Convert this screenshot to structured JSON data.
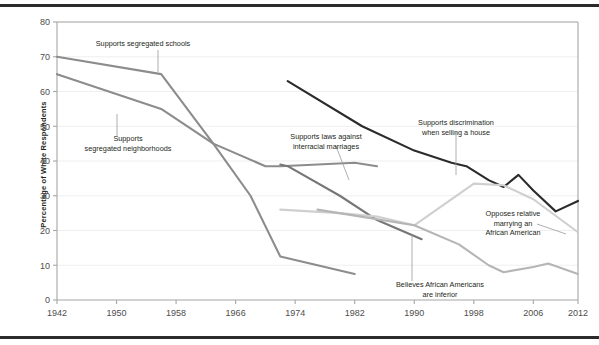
{
  "figure": {
    "ylabel": "Percentage of White Respondents",
    "y_ticks": [
      0,
      10,
      20,
      30,
      40,
      50,
      60,
      70,
      80
    ],
    "x_ticks": [
      1942,
      1950,
      1958,
      1966,
      1974,
      1982,
      1990,
      1998,
      2006,
      2012
    ]
  },
  "annotations": {
    "schools": {
      "line1": "Supports segregated schools",
      "line2": ""
    },
    "neighborhoods": {
      "line1": "Supports",
      "line2": "segregated neighborhoods"
    },
    "interracial": {
      "line1": "Supports laws against",
      "line2": "interracial marriages"
    },
    "selling": {
      "line1": "Supports discrimination",
      "line2": "when selling a house"
    },
    "relative": {
      "line1": "Opposes relative",
      "line2": "marrying an",
      "line3": "African American"
    },
    "inferior": {
      "line1": "Believes African Americans",
      "line2": "are inferior"
    }
  },
  "colors": {
    "schools": "#8c8c8c",
    "neighborhoods": "#8c8c8c",
    "interracial": "#767676",
    "selling": "#2b2b2b",
    "relative": "#cfcfcf",
    "inferior": "#b5b5b5",
    "axis": "#a6a6a6",
    "grid": "#efefef",
    "text": "#231f20",
    "rule": "#2b2b2b"
  },
  "chart_data": {
    "type": "line",
    "title": "",
    "xlabel": "",
    "ylabel": "Percentage of White Respondents",
    "xlim": [
      1942,
      2012
    ],
    "ylim": [
      0,
      80
    ],
    "grid": true,
    "legend_position": "inline-annotations",
    "xticks": [
      1942,
      1950,
      1958,
      1966,
      1974,
      1982,
      1990,
      1998,
      2006,
      2012
    ],
    "yticks": [
      0,
      10,
      20,
      30,
      40,
      50,
      60,
      70,
      80
    ],
    "series": [
      {
        "name": "Supports segregated schools",
        "color": "#8c8c8c",
        "x": [
          1942,
          1956,
          1963,
          1970,
          1972,
          1982,
          1985
        ],
        "values": [
          70,
          65,
          45,
          38.5,
          38.5,
          39.5,
          38.5
        ]
      },
      {
        "name": "Supports segregated neighborhoods",
        "color": "#8c8c8c",
        "x": [
          1942,
          1956,
          1963,
          1968,
          1972,
          1982
        ],
        "values": [
          65,
          55,
          45,
          30,
          12.5,
          7.5
        ]
      },
      {
        "name": "Supports laws against interracial marriages",
        "color": "#767676",
        "x": [
          1972,
          1973,
          1980,
          1985,
          1991
        ],
        "values": [
          39,
          38.5,
          30,
          23,
          17.5
        ]
      },
      {
        "name": "Supports discrimination when selling a house",
        "color": "#2b2b2b",
        "x": [
          1973,
          1983,
          1990,
          1995,
          1997,
          2000,
          2002,
          2004,
          2006,
          2009,
          2012
        ],
        "values": [
          63,
          50,
          43,
          39.5,
          38.5,
          34.5,
          32.5,
          36,
          31.5,
          25.5,
          28.5
        ]
      },
      {
        "name": "Opposes relative marrying an African American",
        "color": "#cfcfcf",
        "x": [
          1972,
          1980,
          1985,
          1990,
          1998,
          2002,
          2006,
          2012
        ],
        "values": [
          26,
          25,
          24,
          21.5,
          33.5,
          33,
          29,
          19.5
        ]
      },
      {
        "name": "Believes African Americans are inferior",
        "color": "#b5b5b5",
        "x": [
          1977,
          1990,
          1996,
          2000,
          2002,
          2006,
          2008,
          2012
        ],
        "values": [
          26,
          21.5,
          16,
          10,
          8,
          9.5,
          10.5,
          7.5
        ]
      }
    ]
  }
}
